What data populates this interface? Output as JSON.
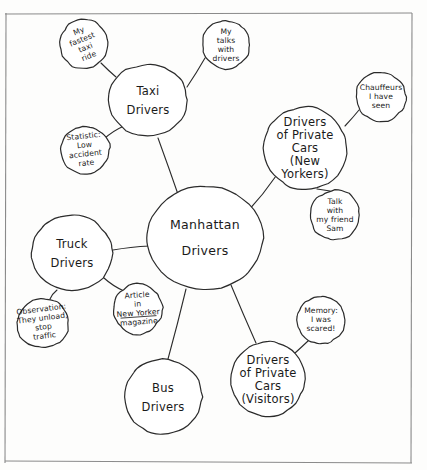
{
  "diagram": {
    "style": "hand-drawn pencil sketch on paper",
    "ink_color": "#2b2b2b",
    "paper_color": "#fdfdfc",
    "frame_color": "#8a8a8a"
  },
  "hub": {
    "id": "manhattan-drivers",
    "lines": [
      "Manhattan",
      "Drivers"
    ],
    "cx": 205,
    "cy": 238,
    "rx": 58,
    "ry": 52
  },
  "main_nodes": [
    {
      "id": "taxi-drivers",
      "lines": [
        "Taxi",
        "Drivers"
      ],
      "cx": 148,
      "cy": 100,
      "rx": 40,
      "ry": 36
    },
    {
      "id": "drivers-private-cars-new-yorkers",
      "lines": [
        "Drivers",
        "of Private",
        "Cars",
        "(New",
        "Yorkers)"
      ],
      "cx": 305,
      "cy": 148,
      "rx": 42,
      "ry": 42
    },
    {
      "id": "truck-drivers",
      "lines": [
        "Truck",
        "Drivers"
      ],
      "cx": 72,
      "cy": 253,
      "rx": 41,
      "ry": 38
    },
    {
      "id": "bus-drivers",
      "lines": [
        "Bus",
        "Drivers"
      ],
      "cx": 163,
      "cy": 397,
      "rx": 39,
      "ry": 38
    },
    {
      "id": "drivers-private-cars-visitors",
      "lines": [
        "Drivers",
        "of Private",
        "Cars",
        "(Visitors)"
      ],
      "cx": 268,
      "cy": 379,
      "rx": 37,
      "ry": 38
    }
  ],
  "satellites": [
    {
      "id": "my-fastest-taxi-ride",
      "parent": "taxi-drivers",
      "lines": [
        "My",
        "fastest",
        "taxi",
        "ride"
      ],
      "cx": 84,
      "cy": 44,
      "rx": 24,
      "ry": 25,
      "rotate": -22
    },
    {
      "id": "my-talks-with-drivers",
      "parent": "taxi-drivers",
      "lines": [
        "My",
        "talks",
        "with",
        "drivers"
      ],
      "cx": 226,
      "cy": 45,
      "rx": 24,
      "ry": 24,
      "rotate": 0
    },
    {
      "id": "statistic-low-accident-rate",
      "parent": "taxi-drivers",
      "lines": [
        "Statistic:",
        "Low",
        "accident",
        "rate"
      ],
      "cx": 85,
      "cy": 150,
      "rx": 25,
      "ry": 24,
      "rotate": -6
    },
    {
      "id": "chauffeurs-i-have-seen",
      "parent": "drivers-private-cars-new-yorkers",
      "lines": [
        "Chauffeurs",
        "I have",
        "seen"
      ],
      "cx": 381,
      "cy": 97,
      "rx": 25,
      "ry": 25,
      "rotate": 0
    },
    {
      "id": "talk-with-my-friend-sam",
      "parent": "drivers-private-cars-new-yorkers",
      "lines": [
        "Talk",
        "with",
        "my friend",
        "Sam"
      ],
      "cx": 335,
      "cy": 215,
      "rx": 25,
      "ry": 25,
      "rotate": 0
    },
    {
      "id": "observation-they-unload-stop-traffic",
      "parent": "truck-drivers",
      "lines": [
        "Observation:",
        "They unload,",
        "stop",
        "traffic"
      ],
      "cx": 43,
      "cy": 323,
      "rx": 26,
      "ry": 25,
      "rotate": -7
    },
    {
      "id": "article-in-new-yorker-magazine",
      "parent": "truck-drivers",
      "lines": [
        "Article",
        "in",
        "New Yorker",
        "magazine"
      ],
      "cx": 138,
      "cy": 309,
      "rx": 25,
      "ry": 25,
      "rotate": -4,
      "underline_line": 2
    },
    {
      "id": "memory-i-was-scared",
      "parent": "drivers-private-cars-visitors",
      "lines": [
        "Memory:",
        "I was",
        "scared!"
      ],
      "cx": 321,
      "cy": 320,
      "rx": 24,
      "ry": 24,
      "rotate": 0
    }
  ],
  "connectors": [
    {
      "id": "hub-to-taxi",
      "x1": 180,
      "y1": 200,
      "x2": 158,
      "y2": 138
    },
    {
      "id": "hub-to-private-ny",
      "x1": 248,
      "y1": 211,
      "x2": 276,
      "y2": 176
    },
    {
      "id": "hub-to-truck",
      "x1": 150,
      "y1": 246,
      "x2": 113,
      "y2": 250
    },
    {
      "id": "hub-to-bus",
      "x1": 186,
      "y1": 289,
      "x2": 168,
      "y2": 359
    },
    {
      "id": "hub-to-private-visitors",
      "x1": 231,
      "y1": 285,
      "x2": 256,
      "y2": 343
    },
    {
      "id": "taxi-to-fastest-ride",
      "x1": 116,
      "y1": 77,
      "x2": 101,
      "y2": 63
    },
    {
      "id": "taxi-to-talks",
      "x1": 187,
      "y1": 87,
      "x2": 205,
      "y2": 58
    },
    {
      "id": "taxi-to-statistic",
      "x1": 124,
      "y1": 126,
      "x2": 104,
      "y2": 139
    },
    {
      "id": "private-ny-to-chauffeurs",
      "x1": 345,
      "y1": 126,
      "x2": 359,
      "y2": 110
    },
    {
      "id": "private-ny-to-sam",
      "x1": 317,
      "y1": 189,
      "x2": 330,
      "y2": 191
    },
    {
      "id": "truck-to-observation",
      "x1": 57,
      "y1": 290,
      "x2": 50,
      "y2": 299
    },
    {
      "id": "truck-to-article",
      "x1": 104,
      "y1": 278,
      "x2": 124,
      "y2": 291
    },
    {
      "id": "visitors-to-memory",
      "x1": 295,
      "y1": 353,
      "x2": 308,
      "y2": 341
    }
  ],
  "frame": {
    "top_y": 13,
    "bottom_y": 463,
    "left_x": 5,
    "right_x": 412
  }
}
